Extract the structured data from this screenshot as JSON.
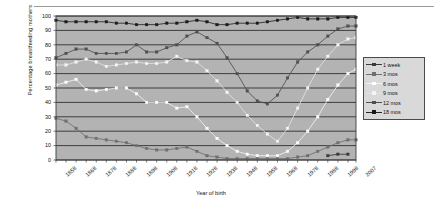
{
  "figure": {
    "ylabel": "Percentage breastfeeding mothers",
    "xlabel": "Year of birth"
  },
  "axis": {
    "y_ticks": [
      "100",
      "90",
      "80",
      "70",
      "60",
      "50",
      "40",
      "30",
      "20",
      "10",
      "0"
    ],
    "x_ticks": [
      "1858",
      "1868",
      "1878",
      "1888",
      "1898",
      "1908",
      "1918",
      "1928",
      "1938",
      "1948",
      "1958",
      "1968",
      "1978",
      "1988",
      "1998",
      "2007"
    ]
  },
  "legend": {
    "items": [
      {
        "label": "1 week",
        "color": "#3a3a3a",
        "marker": "#3a3a3a"
      },
      {
        "label": "3 mos",
        "color": "#6f6f6f",
        "marker": "#6f6f6f"
      },
      {
        "label": "6 mos",
        "color": "#f2f2f2",
        "marker": "#ffffff"
      },
      {
        "label": "9 mos",
        "color": "#e2e2e2",
        "marker": "#f5f5f5"
      },
      {
        "label": "12 mos",
        "color": "#4f4f4f",
        "marker": "#4f4f4f"
      },
      {
        "label": "18 mos",
        "color": "#262626",
        "marker": "#1a1a1a"
      }
    ]
  },
  "colors": {
    "plot_background": "#b3b3b3",
    "gridline": "#1f1f1f",
    "axis": "#3f3f3f",
    "page_background": "#ffffff"
  },
  "chart_data": {
    "type": "line",
    "title": "",
    "xlabel": "Year of birth",
    "ylabel": "Percentage breastfeeding mothers",
    "xlim": [
      1858,
      2007
    ],
    "ylim": [
      0,
      100
    ],
    "grid": true,
    "legend_position": "right",
    "x": [
      1858,
      1863,
      1868,
      1873,
      1878,
      1883,
      1888,
      1893,
      1898,
      1903,
      1908,
      1913,
      1918,
      1923,
      1928,
      1933,
      1938,
      1943,
      1948,
      1953,
      1958,
      1963,
      1968,
      1973,
      1978,
      1983,
      1988,
      1993,
      1998,
      2003,
      2007
    ],
    "series": [
      {
        "name": "18 mos",
        "values": [
          97,
          96,
          96,
          96,
          96,
          96,
          95,
          95,
          94,
          94,
          94,
          95,
          95,
          96,
          97,
          96,
          94,
          94,
          95,
          95,
          95,
          96,
          97,
          98,
          99,
          98,
          98,
          98,
          99,
          99,
          99
        ]
      },
      {
        "name": "12 mos",
        "values": [
          71,
          74,
          77,
          77,
          74,
          74,
          74,
          75,
          80,
          75,
          75,
          78,
          80,
          86,
          89,
          85,
          81,
          71,
          60,
          48,
          41,
          39,
          45,
          57,
          68,
          75,
          80,
          86,
          91,
          93,
          93
        ]
      },
      {
        "name": "9 mos",
        "values": [
          66,
          66,
          68,
          70,
          68,
          65,
          66,
          67,
          68,
          67,
          67,
          68,
          72,
          69,
          68,
          62,
          55,
          47,
          40,
          31,
          24,
          18,
          13,
          22,
          36,
          50,
          63,
          72,
          80,
          84,
          85
        ]
      },
      {
        "name": "6 mos",
        "values": [
          52,
          54,
          56,
          49,
          48,
          49,
          50,
          50,
          46,
          40,
          40,
          40,
          36,
          37,
          30,
          22,
          15,
          10,
          6,
          4,
          3,
          3,
          3,
          6,
          12,
          20,
          30,
          42,
          52,
          60,
          63
        ]
      },
      {
        "name": "3 mos",
        "values": [
          29,
          27,
          22,
          16,
          15,
          14,
          13,
          12,
          10,
          8,
          7,
          7,
          8,
          9,
          6,
          3,
          2,
          1,
          1,
          1,
          1,
          1,
          1,
          1,
          2,
          3,
          6,
          9,
          12,
          14,
          14
        ]
      },
      {
        "name": "1 week",
        "values": [
          null,
          null,
          null,
          null,
          null,
          null,
          null,
          null,
          null,
          null,
          null,
          null,
          null,
          null,
          null,
          null,
          null,
          null,
          null,
          null,
          null,
          null,
          null,
          null,
          null,
          null,
          null,
          3,
          4,
          4,
          null
        ]
      }
    ]
  }
}
